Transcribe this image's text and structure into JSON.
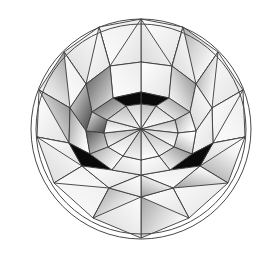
{
  "figure": {
    "title": "Round Brilliant Cut Diamond - Crown View",
    "view": "top",
    "background_color": "#ffffff",
    "outline_color": "#3a3a3a",
    "canvas": {
      "width": 268,
      "height": 256
    }
  },
  "geometry": {
    "center": {
      "x": 141,
      "y": 129
    },
    "girdle_radius": 110,
    "upper_girdle_radius": 96,
    "bezel_inner_radius": 62,
    "star_radius": 44,
    "table_radius": 33,
    "facet_count_main": 8,
    "spoke_count": 16,
    "rotation_deg": 11
  },
  "shading": {
    "white": "#ffffff",
    "light_gray": "#efefef",
    "mid_gray": "#b9b9b9",
    "dark_gray": "#6e6e6e",
    "black": "#0a0a0a",
    "highlight": "#fdfdfd"
  },
  "facet_rings": [
    {
      "name": "girdle-ring",
      "label": "Upper girdle / half facets",
      "count": 16,
      "tones": [
        "white",
        "light_gray",
        "white",
        "mid_gray",
        "white",
        "light_gray",
        "white",
        "white",
        "light_gray",
        "white",
        "mid_gray",
        "white",
        "light_gray",
        "white",
        "white",
        "light_gray"
      ]
    },
    {
      "name": "bezel-ring",
      "label": "Bezel / kite facets",
      "count": 8,
      "tones": [
        "white",
        "light_gray",
        "white",
        "mid_gray",
        "black",
        "mid_gray",
        "white",
        "light_gray"
      ]
    },
    {
      "name": "star-ring",
      "label": "Star facets",
      "count": 8,
      "tones": [
        "mid_gray",
        "white",
        "light_gray",
        "dark_gray",
        "black",
        "light_gray",
        "white",
        "mid_gray"
      ]
    },
    {
      "name": "table-ring",
      "label": "Table reflection spokes",
      "count": 16,
      "tones": [
        "white",
        "light_gray",
        "white",
        "light_gray",
        "white",
        "light_gray",
        "white",
        "light_gray",
        "white",
        "light_gray",
        "white",
        "light_gray",
        "white",
        "light_gray",
        "white",
        "light_gray"
      ]
    }
  ],
  "dark_accents": [
    {
      "name": "bottom-left-black-triangle",
      "position": "lower-left-bezel"
    },
    {
      "name": "bottom-right-black-triangle",
      "position": "lower-right-bezel"
    },
    {
      "name": "top-center-black-bowtie",
      "position": "upper-star-ring"
    },
    {
      "name": "inner-ring-dark-wedges",
      "position": "star-ring"
    }
  ]
}
